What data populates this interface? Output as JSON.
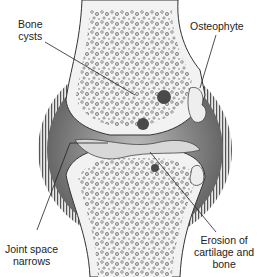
{
  "diagram": {
    "labels": {
      "bone_cysts": [
        "Bone",
        "cysts"
      ],
      "osteophyte": "Osteophyte",
      "joint_space": [
        "Joint space",
        "narrows"
      ],
      "erosion": [
        "Erosion of",
        "cartilage and",
        "bone"
      ]
    },
    "colors": {
      "bone": "#f2f2f2",
      "capsule_dark": "#6a6a6a",
      "capsule_stripes": "#555555",
      "cyst": "#4a4a4a",
      "outline": "#333333"
    }
  }
}
